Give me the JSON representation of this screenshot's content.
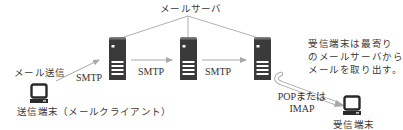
{
  "diagram": {
    "title_label": "メールサーバ",
    "sender": {
      "action_label": "メール送信",
      "device_label": "送信端末（メールクライアント）"
    },
    "receiver": {
      "device_label": "受信端末"
    },
    "protocols": {
      "smtp_1": "SMTP",
      "smtp_2": "SMTP",
      "smtp_3": "SMTP",
      "pop_imap_line1": "POPまたは",
      "pop_imap_line2": "IMAP"
    },
    "note": {
      "line1": "受信端末は最寄り",
      "line2": "のメールサーバから",
      "line3": "メールを取り出す。"
    },
    "nodes": [
      "送信端末（メールクライアント）",
      "メールサーバ",
      "メールサーバ",
      "メールサーバ",
      "受信端末"
    ],
    "edges": [
      {
        "from": "送信端末",
        "to": "メールサーバ1",
        "label": "SMTP"
      },
      {
        "from": "メールサーバ1",
        "to": "メールサーバ2",
        "label": "SMTP"
      },
      {
        "from": "メールサーバ2",
        "to": "メールサーバ3",
        "label": "SMTP"
      },
      {
        "from": "メールサーバ3",
        "to": "受信端末",
        "label": "POPまたはIMAP"
      }
    ],
    "colors": {
      "server_dark": "#3a3a3a",
      "line_gray": "#a8a8a8",
      "text": "#333333"
    }
  }
}
